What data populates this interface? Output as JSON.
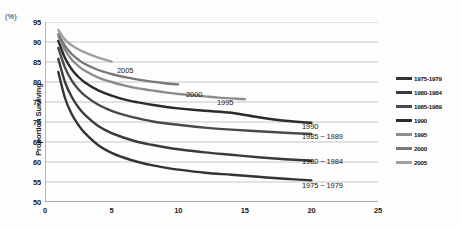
{
  "chart_data": {
    "type": "line",
    "title": "",
    "xlabel": "",
    "ylabel": "Proportion Surviving",
    "yunit": "(%)",
    "xlim": [
      0,
      25
    ],
    "ylim": [
      50,
      95
    ],
    "xticks": [
      "0",
      "5",
      "10",
      "15",
      "20",
      "25"
    ],
    "yticks": [
      "95",
      "90",
      "85",
      "80",
      "75",
      "70",
      "65",
      "60",
      "55",
      "50"
    ],
    "grid": "horizontal",
    "legend_position": "right",
    "series": [
      {
        "name": "1975-1979",
        "legend_label": "1975-1979",
        "callout": "1975 ~ 1979",
        "color": "#333333",
        "callout_x": 302,
        "callout_y": 181,
        "points": [
          [
            1,
            82.5
          ],
          [
            1.5,
            76.0
          ],
          [
            2,
            72.0
          ],
          [
            2.5,
            69.3
          ],
          [
            3,
            67.2
          ],
          [
            4,
            64.2
          ],
          [
            5,
            62.3
          ],
          [
            6,
            61.0
          ],
          [
            7,
            60.0
          ],
          [
            8,
            59.2
          ],
          [
            9,
            58.6
          ],
          [
            10,
            58.1
          ],
          [
            12,
            57.3
          ],
          [
            14,
            56.8
          ],
          [
            16,
            56.3
          ],
          [
            18,
            55.8
          ],
          [
            20,
            55.4
          ]
        ]
      },
      {
        "name": "1980-1984",
        "legend_label": "1980-1984",
        "callout": "1980 ~ 1984",
        "color": "#3a3a3a",
        "callout_x": 302,
        "callout_y": 157,
        "points": [
          [
            1,
            85.8
          ],
          [
            1.5,
            80.0
          ],
          [
            2,
            76.3
          ],
          [
            2.5,
            73.7
          ],
          [
            3,
            71.8
          ],
          [
            4,
            69.0
          ],
          [
            5,
            67.2
          ],
          [
            6,
            66.0
          ],
          [
            7,
            65.0
          ],
          [
            8,
            64.3
          ],
          [
            9,
            63.7
          ],
          [
            10,
            63.2
          ],
          [
            12,
            62.4
          ],
          [
            14,
            61.8
          ],
          [
            16,
            61.2
          ],
          [
            18,
            60.7
          ],
          [
            20,
            60.3
          ]
        ]
      },
      {
        "name": "1985-1989",
        "legend_label": "1985-1989",
        "callout": "1985 ~ 1989",
        "color": "#4a4a4a",
        "callout_x": 302,
        "callout_y": 132,
        "points": [
          [
            1,
            88.5
          ],
          [
            1.5,
            83.6
          ],
          [
            2,
            80.4
          ],
          [
            2.5,
            78.2
          ],
          [
            3,
            76.6
          ],
          [
            4,
            74.3
          ],
          [
            5,
            72.8
          ],
          [
            6,
            71.7
          ],
          [
            7,
            70.9
          ],
          [
            8,
            70.2
          ],
          [
            9,
            69.7
          ],
          [
            10,
            69.3
          ],
          [
            12,
            68.6
          ],
          [
            14,
            68.1
          ],
          [
            16,
            67.7
          ],
          [
            18,
            67.3
          ],
          [
            20,
            67.0
          ]
        ]
      },
      {
        "name": "1990",
        "legend_label": "1990",
        "callout": "1990",
        "color": "#2b2b2b",
        "callout_x": 302,
        "callout_y": 122,
        "points": [
          [
            1,
            90.3
          ],
          [
            1.5,
            86.0
          ],
          [
            2,
            83.2
          ],
          [
            2.5,
            81.3
          ],
          [
            3,
            79.9
          ],
          [
            4,
            77.9
          ],
          [
            5,
            76.6
          ],
          [
            6,
            75.6
          ],
          [
            7,
            74.9
          ],
          [
            8,
            74.3
          ],
          [
            9,
            73.8
          ],
          [
            10,
            73.4
          ],
          [
            12,
            72.8
          ],
          [
            14,
            72.3
          ],
          [
            16,
            71.2
          ],
          [
            18,
            70.3
          ],
          [
            20,
            69.8
          ]
        ]
      },
      {
        "name": "1995",
        "legend_label": "1995",
        "callout": "1995",
        "color": "#8c8c8c",
        "callout_x": 217,
        "callout_y": 98,
        "points": [
          [
            1,
            91.5
          ],
          [
            1.5,
            88.0
          ],
          [
            2,
            85.6
          ],
          [
            2.5,
            84.0
          ],
          [
            3,
            82.8
          ],
          [
            4,
            81.1
          ],
          [
            5,
            80.0
          ],
          [
            6,
            79.1
          ],
          [
            7,
            78.4
          ],
          [
            8,
            77.9
          ],
          [
            9,
            77.4
          ],
          [
            10,
            77.0
          ],
          [
            11,
            76.7
          ],
          [
            12,
            76.4
          ],
          [
            13,
            76.1
          ],
          [
            14,
            75.9
          ],
          [
            15,
            75.7
          ]
        ]
      },
      {
        "name": "2000",
        "legend_label": "2000",
        "callout": "2000",
        "color": "#787878",
        "callout_x": 186,
        "callout_y": 90,
        "points": [
          [
            1,
            92.0
          ],
          [
            1.5,
            89.0
          ],
          [
            2,
            87.0
          ],
          [
            2.5,
            85.6
          ],
          [
            3,
            84.5
          ],
          [
            4,
            83.0
          ],
          [
            5,
            82.0
          ],
          [
            6,
            81.2
          ],
          [
            7,
            80.6
          ],
          [
            8,
            80.1
          ],
          [
            9,
            79.7
          ],
          [
            10,
            79.4
          ]
        ]
      },
      {
        "name": "2005",
        "legend_label": "2005",
        "callout": "2005",
        "color": "#a0a0a0",
        "callout_x": 117,
        "callout_y": 66,
        "points": [
          [
            1,
            93.0
          ],
          [
            1.5,
            90.6
          ],
          [
            2,
            89.2
          ],
          [
            2.5,
            88.2
          ],
          [
            3,
            87.4
          ],
          [
            3.5,
            86.7
          ],
          [
            4,
            86.1
          ],
          [
            4.5,
            85.6
          ],
          [
            5,
            85.1
          ]
        ]
      }
    ]
  }
}
